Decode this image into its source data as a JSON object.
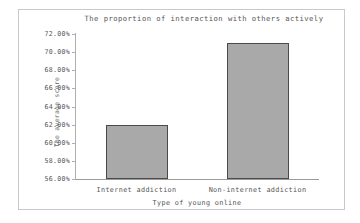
{
  "chart_data": {
    "type": "bar",
    "title": "The proportion of interaction with others actively",
    "xlabel": "Type of young online",
    "ylabel": "The average score",
    "categories": [
      "Internet addiction",
      "Non-internet addiction"
    ],
    "values": [
      62.0,
      71.0
    ],
    "value_labels": [
      "62.00%",
      "71.00%"
    ],
    "ylim": [
      56.0,
      72.0
    ],
    "ytick_values": [
      72.0,
      70.0,
      68.0,
      66.0,
      64.0,
      62.0,
      60.0,
      58.0,
      56.0
    ],
    "ytick_labels": [
      "72.00%",
      "70.00%",
      "68.00%",
      "66.00%",
      "64.00%",
      "62.00%",
      "60.00%",
      "58.00%",
      "56.00%"
    ],
    "grid": false,
    "legend": false,
    "bar_fill_color": "#a9a9a9",
    "bar_edge_color": "#4a4a4a",
    "frame_color": "#c9c9c9",
    "axis_color": "#b0b0b0",
    "text_color": "#555555"
  }
}
